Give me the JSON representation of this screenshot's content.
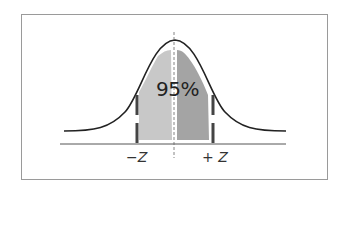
{
  "diagram": {
    "type": "normal-distribution",
    "center_label": "95%",
    "left_bound_label": "−Z",
    "right_bound_label": "+ Z",
    "colors": {
      "curve": "#222222",
      "left_area": "#c8c8c8",
      "right_area": "#a4a4a4",
      "bound_lines": "#444444",
      "axis": "#555555",
      "frame": "#9a9a9a"
    }
  }
}
